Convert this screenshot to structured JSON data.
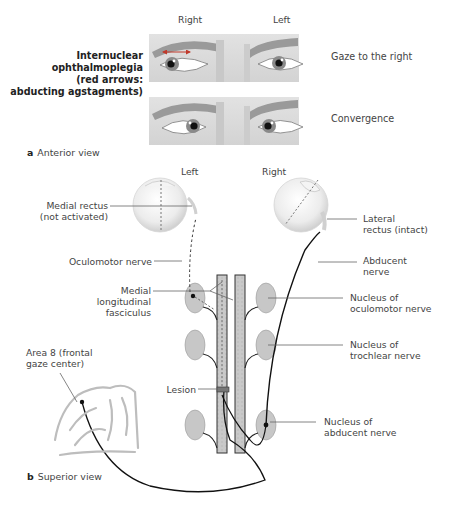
{
  "panel_a": {
    "column_labels": {
      "right": "Right",
      "left": "Left"
    },
    "title_lines": [
      "Internuclear",
      "ophthalmoplegia",
      "(red arrows:",
      "abducting agstagments)"
    ],
    "rows": [
      {
        "label": "Gaze to the right"
      },
      {
        "label": "Convergence"
      }
    ],
    "caption_letter": "a",
    "caption_text": "Anterior view",
    "arrow_color": "#c0392b"
  },
  "panel_b": {
    "eye_labels": {
      "left": "Left",
      "right": "Right"
    },
    "labels": {
      "medial_rectus": [
        "Medial rectus",
        "(not activated)"
      ],
      "lateral_rectus": [
        "Lateral",
        "rectus (intact)"
      ],
      "oculomotor_nerve": "Oculomotor nerve",
      "abducent_nerve": [
        "Abducent",
        "nerve"
      ],
      "mlf": [
        "Medial",
        "longitudinal",
        "fasciculus"
      ],
      "nucleus_oculomotor": [
        "Nucleus of",
        "oculomotor nerve"
      ],
      "nucleus_trochlear": [
        "Nucleus of",
        "trochlear nerve"
      ],
      "area8": [
        "Area 8 (frontal",
        "gaze center)"
      ],
      "lesion": "Lesion",
      "nucleus_abducent": [
        "Nucleus of",
        "abducent nerve"
      ]
    },
    "caption_letter": "b",
    "caption_text": "Superior view"
  }
}
